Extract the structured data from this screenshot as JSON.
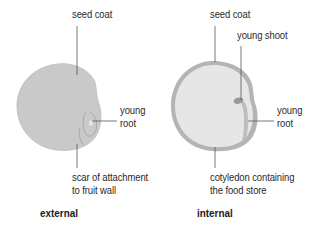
{
  "diagram": {
    "type": "labeled-illustration",
    "colors": {
      "seed_fill_external": "#c9c9c9",
      "seed_coat_ring": "#b4b4b4",
      "seed_fill_internal": "#e6e6e6",
      "leader_line": "#555555",
      "text": "#2a2a2a"
    },
    "external": {
      "caption": "external",
      "labels": {
        "seed_coat": "seed coat",
        "young_root_line1": "young",
        "young_root_line2": "root",
        "scar_line1": "scar of attachment",
        "scar_line2": "to fruit wall"
      }
    },
    "internal": {
      "caption": "internal",
      "labels": {
        "seed_coat": "seed coat",
        "young_shoot": "young shoot",
        "young_root_line1": "young",
        "young_root_line2": "root",
        "cotyledon_line1": "cotyledon containing",
        "cotyledon_line2": "the food store"
      }
    }
  }
}
